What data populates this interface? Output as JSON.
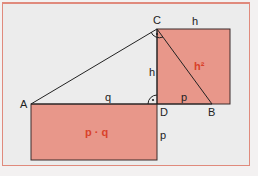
{
  "diagram": {
    "colors": {
      "fill": "#e8978a",
      "stroke": "#3a2a2a",
      "highlight_text": "#d9422a",
      "frame": "#e08a7c"
    },
    "points": {
      "A": "A",
      "B": "B",
      "C": "C",
      "D": "D"
    },
    "segment_labels": {
      "q": "q",
      "h_vertical": "h",
      "h_top": "h",
      "p_bottom": "p",
      "p_right": "p"
    },
    "area_labels": {
      "square": "h²",
      "rectangle": "p · q"
    },
    "right_angle_markers": [
      "C",
      "D"
    ]
  }
}
